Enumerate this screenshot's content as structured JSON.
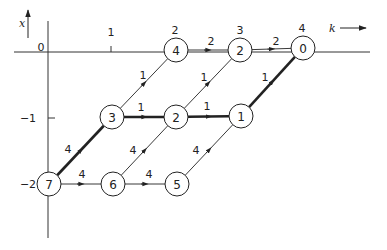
{
  "axes": {
    "x_label": "x",
    "k_label": "k",
    "x_ticks": [
      {
        "label": "0",
        "x": 41,
        "y": 51
      },
      {
        "label": "1",
        "x": 111,
        "y": 36
      }
    ],
    "y_ticks": [
      {
        "label": "−1",
        "x": 28,
        "y": 122,
        "tick_y": 118
      },
      {
        "label": "−2",
        "x": 28,
        "y": 188
      }
    ]
  },
  "stage_labels": [
    {
      "label": "2",
      "x": 175,
      "y": 34
    },
    {
      "label": "3",
      "x": 240,
      "y": 34
    },
    {
      "label": "4",
      "x": 302,
      "y": 32
    }
  ],
  "nodes": [
    {
      "id": "n7",
      "label": "7",
      "x": 49,
      "y": 184
    },
    {
      "id": "n6",
      "label": "6",
      "x": 113,
      "y": 184
    },
    {
      "id": "n5",
      "label": "5",
      "x": 177,
      "y": 184
    },
    {
      "id": "n3",
      "label": "3",
      "x": 112,
      "y": 117
    },
    {
      "id": "n2m",
      "label": "2",
      "x": 176,
      "y": 117
    },
    {
      "id": "n1",
      "label": "1",
      "x": 241,
      "y": 116
    },
    {
      "id": "n4",
      "label": "4",
      "x": 176,
      "y": 50
    },
    {
      "id": "n2t",
      "label": "2",
      "x": 240,
      "y": 50
    },
    {
      "id": "n0",
      "label": "0",
      "x": 303,
      "y": 48
    }
  ],
  "edges": [
    {
      "from": "n7",
      "to": "n6",
      "weight": "4",
      "bold": false,
      "lx": 82,
      "ly": 178
    },
    {
      "from": "n6",
      "to": "n5",
      "weight": "4",
      "bold": false,
      "lx": 149,
      "ly": 178
    },
    {
      "from": "n7",
      "to": "n3",
      "weight": "4",
      "bold": true,
      "lx": 68,
      "ly": 153
    },
    {
      "from": "n6",
      "to": "n2m",
      "weight": "4",
      "bold": false,
      "lx": 133,
      "ly": 154
    },
    {
      "from": "n5",
      "to": "n1",
      "weight": "4",
      "bold": false,
      "lx": 196,
      "ly": 154
    },
    {
      "from": "n3",
      "to": "n2m",
      "weight": "1",
      "bold": true,
      "lx": 141,
      "ly": 111
    },
    {
      "from": "n2m",
      "to": "n1",
      "weight": "1",
      "bold": true,
      "lx": 207,
      "ly": 110
    },
    {
      "from": "n3",
      "to": "n4",
      "weight": "1",
      "bold": false,
      "lx": 143,
      "ly": 79
    },
    {
      "from": "n2m",
      "to": "n2t",
      "weight": "1",
      "bold": false,
      "lx": 204,
      "ly": 81
    },
    {
      "from": "n1",
      "to": "n0",
      "weight": "1",
      "bold": true,
      "lx": 265,
      "ly": 81
    },
    {
      "from": "n4",
      "to": "n2t",
      "weight": "2",
      "bold": false,
      "lx": 211,
      "ly": 45
    },
    {
      "from": "n2t",
      "to": "n0",
      "weight": "2",
      "bold": false,
      "lx": 276,
      "ly": 45
    }
  ]
}
